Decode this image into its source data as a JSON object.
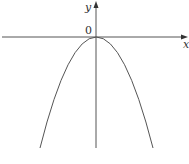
{
  "figure": {
    "type": "function-graph",
    "axes": {
      "x_label": "x",
      "y_label": "y",
      "origin_label": "0"
    },
    "curve": {
      "name": "parabola",
      "vertex": [
        0,
        0
      ],
      "opens": "down"
    },
    "colors": {
      "line": "#555555",
      "text": "#333333",
      "background": "#ffffff"
    }
  }
}
